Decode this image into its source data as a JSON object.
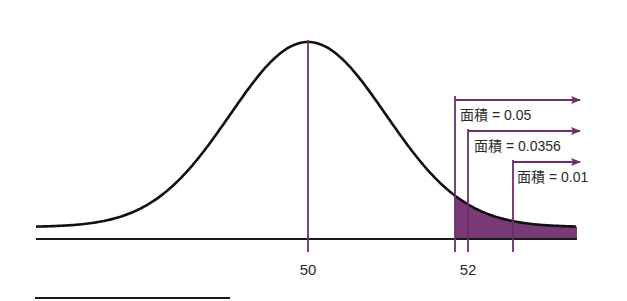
{
  "chart_data": {
    "type": "area",
    "title": "",
    "xlabel": "",
    "ylabel": "",
    "distribution": {
      "kind": "normal",
      "mean": 50
    },
    "x_ticks": [
      {
        "value": 50,
        "label": "50"
      },
      {
        "value": 52,
        "label": "52"
      }
    ],
    "annotations": [
      {
        "label": "面積 = 0.05",
        "area": 0.05,
        "direction": "right-tail"
      },
      {
        "label": "面積 = 0.0356",
        "area": 0.0356,
        "x": 52,
        "direction": "right-tail"
      },
      {
        "label": "面積 = 0.01",
        "area": 0.01,
        "direction": "right-tail"
      }
    ],
    "shaded_region": {
      "from": "critical value for 0.05",
      "to": "right end",
      "color": "#7a3a78"
    },
    "grid": false,
    "legend": null
  },
  "colors": {
    "curve": "#111111",
    "axis": "#1a1a1a",
    "accent": "#6b2f6b",
    "shade": "#7a3a78"
  },
  "labels": {
    "tick_50": "50",
    "tick_52": "52",
    "area_005": "面積 = 0.05",
    "area_00356": "面積 = 0.0356",
    "area_001": "面積 = 0.01"
  }
}
